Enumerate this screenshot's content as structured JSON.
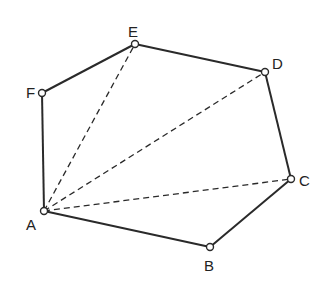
{
  "diagram": {
    "type": "hexagon-diagonals",
    "vertices": [
      {
        "label": "A",
        "x": 44,
        "y": 211,
        "lx": 26,
        "ly": 217
      },
      {
        "label": "B",
        "x": 210,
        "y": 247,
        "lx": 204,
        "ly": 258
      },
      {
        "label": "C",
        "x": 291,
        "y": 179,
        "lx": 299,
        "ly": 173
      },
      {
        "label": "D",
        "x": 265,
        "y": 72,
        "lx": 272,
        "ly": 56
      },
      {
        "label": "E",
        "x": 135,
        "y": 44,
        "lx": 128,
        "ly": 24
      },
      {
        "label": "F",
        "x": 42,
        "y": 93,
        "lx": 26,
        "ly": 85
      }
    ],
    "edges": [
      [
        "A",
        "B"
      ],
      [
        "B",
        "C"
      ],
      [
        "C",
        "D"
      ],
      [
        "D",
        "E"
      ],
      [
        "E",
        "F"
      ],
      [
        "F",
        "A"
      ]
    ],
    "diagonals": [
      [
        "A",
        "E"
      ],
      [
        "A",
        "D"
      ],
      [
        "A",
        "C"
      ]
    ],
    "stroke_color": "#2a2a2a"
  }
}
